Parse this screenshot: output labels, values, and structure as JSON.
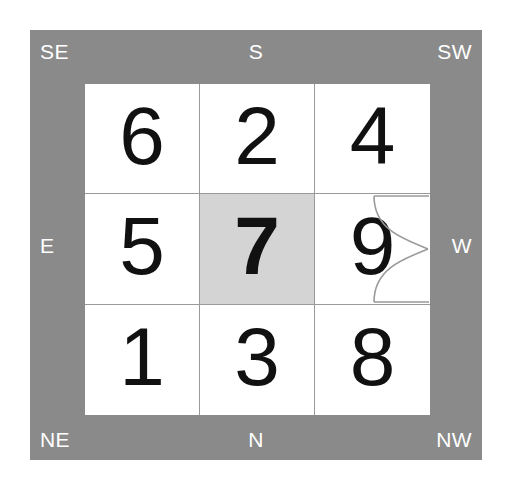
{
  "figure": {
    "panel_color": "#8a8a8a",
    "grid_background": "#ffffff",
    "gridline_color": "#9a9a9a",
    "highlight_color": "#d4d4d4",
    "label_color": "#ffffff",
    "number_color": "#111111"
  },
  "compass": {
    "top_left": "SE",
    "top_center": "S",
    "top_right": "SW",
    "middle_left": "E",
    "middle_right": "W",
    "bottom_left": "NE",
    "bottom_center": "N",
    "bottom_right": "NW"
  },
  "grid": {
    "rows": [
      {
        "cells": [
          {
            "value": "6",
            "highlighted": false
          },
          {
            "value": "2",
            "highlighted": false
          },
          {
            "value": "4",
            "highlighted": false
          }
        ]
      },
      {
        "cells": [
          {
            "value": "5",
            "highlighted": false
          },
          {
            "value": "7",
            "highlighted": true
          },
          {
            "value": "9",
            "highlighted": false
          }
        ]
      },
      {
        "cells": [
          {
            "value": "1",
            "highlighted": false
          },
          {
            "value": "3",
            "highlighted": false
          },
          {
            "value": "8",
            "highlighted": false
          }
        ]
      }
    ]
  },
  "annotation": {
    "shape": "bowtie-hourglass",
    "located_on_cell": "9",
    "stroke_color": "#9a9a9a"
  }
}
